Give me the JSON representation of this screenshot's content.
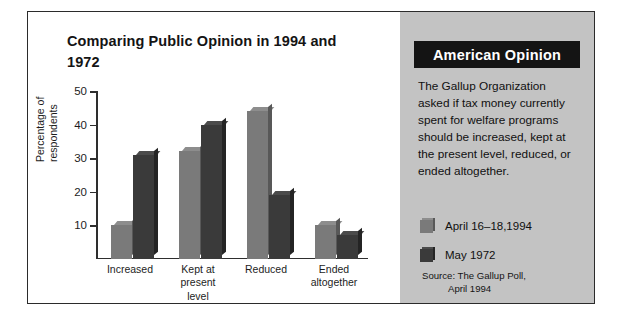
{
  "chart_data": {
    "type": "bar",
    "title": "Comparing Public Opinion in 1994 and 1972",
    "xlabel": "",
    "ylabel": "Percentage of respondents",
    "categories": [
      "Increased",
      "Kept at present level",
      "Reduced",
      "Ended altogether"
    ],
    "category_lines": [
      [
        "Increased"
      ],
      [
        "Kept at",
        "present",
        "level"
      ],
      [
        "Reduced"
      ],
      [
        "Ended",
        "altogether"
      ]
    ],
    "series": [
      {
        "name": "April 16–18,1994",
        "color": "#7a7a7a",
        "values": [
          10,
          32,
          44,
          10
        ]
      },
      {
        "name": "May 1972",
        "color": "#3a3a3a",
        "values": [
          31,
          40,
          19,
          7
        ]
      }
    ],
    "ylim": [
      0,
      50
    ],
    "yticks": [
      10,
      20,
      30,
      40,
      50
    ],
    "ytick_labels": [
      "10",
      "20",
      "30",
      "40",
      "50"
    ],
    "grid": false,
    "legend_position": "right-panel"
  },
  "sidebar": {
    "header": "American Opinion",
    "body": "The Gallup Organization asked if tax money currently spent for welfare programs should be increased, kept at the present level, reduced, or ended altogether.",
    "legend": [
      {
        "label": "April 16–18,1994",
        "color": "#7a7a7a"
      },
      {
        "label": "May 1972",
        "color": "#3a3a3a"
      }
    ],
    "source_line1": "Source: The Gallup Poll,",
    "source_line2": "April 1994"
  },
  "colors": {
    "series_1994": "#7a7a7a",
    "series_1972": "#3a3a3a",
    "sidebar_bg": "#c3c3c3",
    "header_bg": "#141414",
    "frame": "#2b2b2b"
  }
}
